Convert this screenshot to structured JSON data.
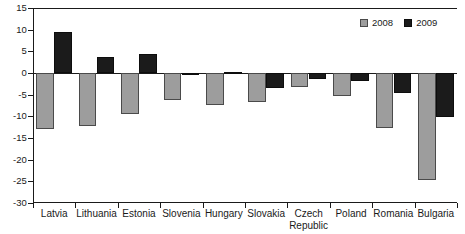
{
  "chart_data": {
    "type": "bar",
    "title": "",
    "xlabel": "",
    "ylabel": "",
    "ylim": [
      -30,
      15
    ],
    "yticks": [
      15,
      10,
      5,
      0,
      -5,
      -10,
      -15,
      -20,
      -25,
      -30
    ],
    "ytick_labels": [
      "15",
      "10",
      "5",
      "0",
      "-5",
      "-10",
      "-15",
      "-20",
      "-25",
      "-30"
    ],
    "grid": false,
    "legend_position": "top-right",
    "categories": [
      "Latvia",
      "Lithuania",
      "Estonia",
      "Slovenia",
      "Hungary",
      "Slovakia",
      "Czech\nRepublic",
      "Poland",
      "Romania",
      "Bulgaria"
    ],
    "series": [
      {
        "name": "2008",
        "color": "#9d9d9d",
        "values": [
          -13.0,
          -12.2,
          -9.5,
          -6.3,
          -7.4,
          -6.7,
          -3.3,
          -5.3,
          -12.7,
          -24.7
        ]
      },
      {
        "name": "2009",
        "color": "#1b1b1b",
        "values": [
          9.5,
          3.7,
          4.4,
          -0.5,
          0.3,
          -3.5,
          -1.3,
          -1.9,
          -4.7,
          -10.2
        ]
      }
    ]
  },
  "legend": {
    "items": [
      {
        "label": "2008"
      },
      {
        "label": "2009"
      }
    ]
  }
}
